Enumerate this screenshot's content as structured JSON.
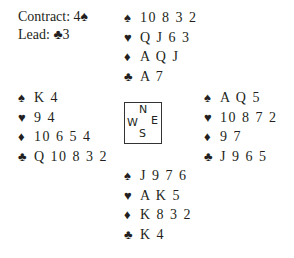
{
  "info": {
    "contract_label": "Contract: 4",
    "contract_suit": "♠",
    "lead_label": "Lead: ",
    "lead_suit": "♣",
    "lead_card": "3"
  },
  "compass": {
    "north": "N",
    "south": "S",
    "west": "W",
    "east": "E"
  },
  "suits": {
    "spades": "♠",
    "hearts": "♥",
    "diamonds": "♦",
    "clubs": "♣"
  },
  "hands": {
    "north": {
      "spades": "10 8 3 2",
      "hearts": "Q J 6 3",
      "diamonds": "A Q J",
      "clubs": "A 7"
    },
    "west": {
      "spades": "K 4",
      "hearts": "9 4",
      "diamonds": "10 6 5 4",
      "clubs": "Q 10 8 3 2"
    },
    "east": {
      "spades": "A Q 5",
      "hearts": "10 8 7 2",
      "diamonds": "9 7",
      "clubs": "J 9 6 5"
    },
    "south": {
      "spades": "J 9 7 6",
      "hearts": "A K 5",
      "diamonds": "K 8 3 2",
      "clubs": "K 4"
    }
  }
}
